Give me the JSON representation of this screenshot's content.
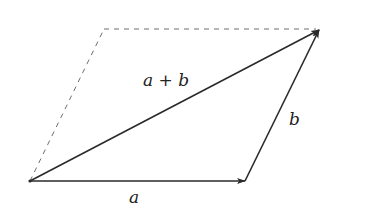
{
  "diagram": {
    "type": "vector-addition-parallelogram",
    "colors": {
      "background": "#ffffff",
      "stroke": "#2a2a2a",
      "dashed": "#6f6f6f",
      "text": "#222222"
    },
    "points": {
      "origin": [
        30,
        181
      ],
      "a_tip": [
        245,
        181
      ],
      "sum_tip": [
        319,
        30
      ],
      "dashed_corner": [
        104,
        29
      ]
    },
    "vectors": [
      {
        "id": "a",
        "label": "a",
        "from": "origin",
        "to": "a_tip"
      },
      {
        "id": "b",
        "label": "b",
        "from": "a_tip",
        "to": "sum_tip"
      },
      {
        "id": "sum",
        "label": "a + b",
        "from": "origin",
        "to": "sum_tip"
      }
    ],
    "dashed_edges": [
      {
        "from": "origin",
        "to": "dashed_corner"
      },
      {
        "from": "dashed_corner",
        "to": "sum_tip"
      }
    ],
    "labels": {
      "a": "a",
      "b": "b",
      "sum_left": "a",
      "sum_op": "+",
      "sum_right": "b"
    }
  }
}
